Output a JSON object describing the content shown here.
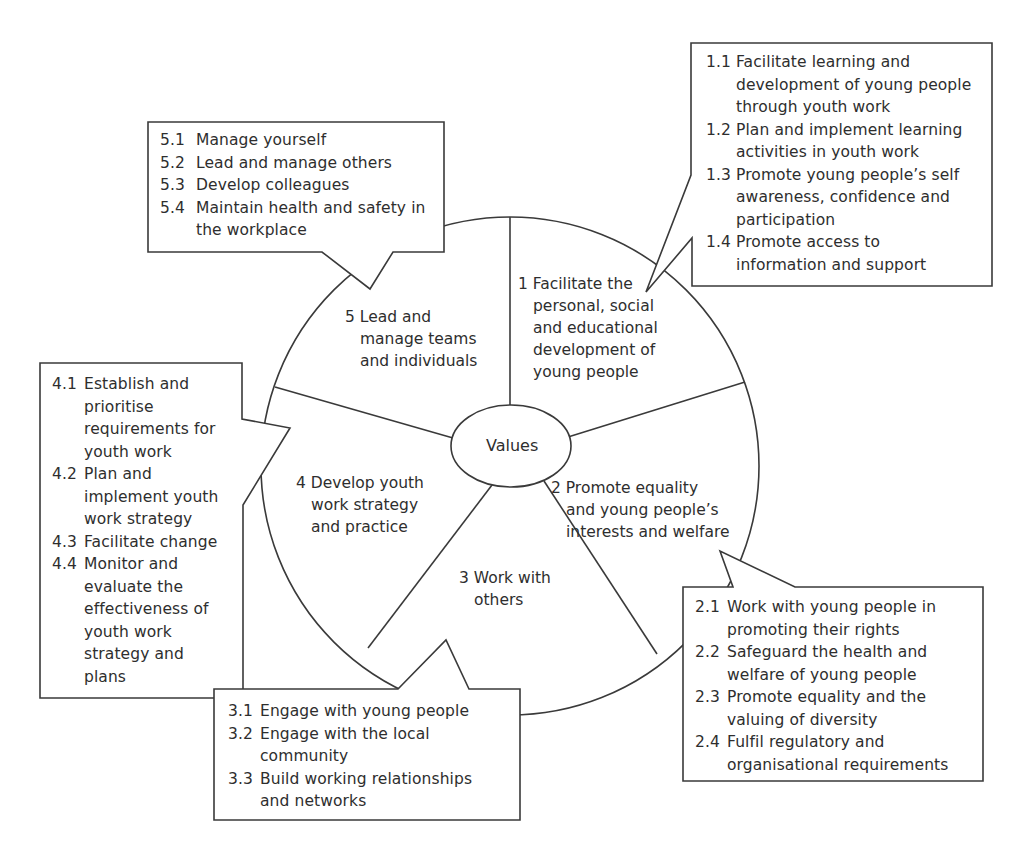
{
  "diagram": {
    "center": {
      "label": "Values"
    },
    "segments": [
      {
        "id": "1",
        "lines": [
          "1 Facilitate the",
          "personal, social",
          "and educational",
          "development of",
          "young people"
        ]
      },
      {
        "id": "2",
        "lines": [
          "2 Promote equality",
          "and young people’s",
          "interests and welfare"
        ]
      },
      {
        "id": "3",
        "lines": [
          "3 Work with",
          "others"
        ]
      },
      {
        "id": "4",
        "lines": [
          "4 Develop youth",
          "work strategy",
          "and practice"
        ]
      },
      {
        "id": "5",
        "lines": [
          "5 Lead and",
          "manage teams",
          "and individuals"
        ]
      }
    ],
    "callouts": {
      "c1": {
        "items": [
          {
            "num": "1.1",
            "lines": [
              "Facilitate learning and",
              "development of young people",
              "through youth work"
            ]
          },
          {
            "num": "1.2",
            "lines": [
              "Plan and implement learning",
              "activities in youth work"
            ]
          },
          {
            "num": "1.3",
            "lines": [
              "Promote young people’s self",
              "awareness, confidence and",
              "participation"
            ]
          },
          {
            "num": "1.4",
            "lines": [
              "Promote access to",
              "information and support"
            ]
          }
        ]
      },
      "c2": {
        "items": [
          {
            "num": "2.1",
            "lines": [
              "Work with young people in",
              "promoting their rights"
            ]
          },
          {
            "num": "2.2",
            "lines": [
              "Safeguard the health and",
              "welfare of young people"
            ]
          },
          {
            "num": "2.3",
            "lines": [
              "Promote equality and the",
              "valuing of diversity"
            ]
          },
          {
            "num": "2.4",
            "lines": [
              "Fulfil regulatory and",
              "organisational requirements"
            ]
          }
        ]
      },
      "c3": {
        "items": [
          {
            "num": "3.1",
            "lines": [
              "Engage with young people"
            ]
          },
          {
            "num": "3.2",
            "lines": [
              "Engage with the local",
              "community"
            ]
          },
          {
            "num": "3.3",
            "lines": [
              "Build working relationships",
              "and networks"
            ]
          }
        ]
      },
      "c4": {
        "items": [
          {
            "num": "4.1",
            "lines": [
              "Establish and",
              "prioritise",
              "requirements for",
              "youth work"
            ]
          },
          {
            "num": "4.2",
            "lines": [
              "Plan and",
              "implement youth",
              "work strategy"
            ]
          },
          {
            "num": "4.3",
            "lines": [
              "Facilitate change"
            ]
          },
          {
            "num": "4.4",
            "lines": [
              "Monitor and",
              "evaluate the",
              "effectiveness of",
              "youth work",
              "strategy and",
              "plans"
            ]
          }
        ]
      },
      "c5": {
        "items": [
          {
            "num": "5.1",
            "lines": [
              "Manage yourself"
            ]
          },
          {
            "num": "5.2",
            "lines": [
              "Lead and manage others"
            ]
          },
          {
            "num": "5.3",
            "lines": [
              "Develop colleagues"
            ]
          },
          {
            "num": "5.4",
            "lines": [
              "Maintain health and safety in",
              "the workplace"
            ]
          }
        ]
      }
    },
    "colors": {
      "stroke": "#3a3a3a",
      "text": "#2e2e2e",
      "background": "#ffffff"
    }
  }
}
